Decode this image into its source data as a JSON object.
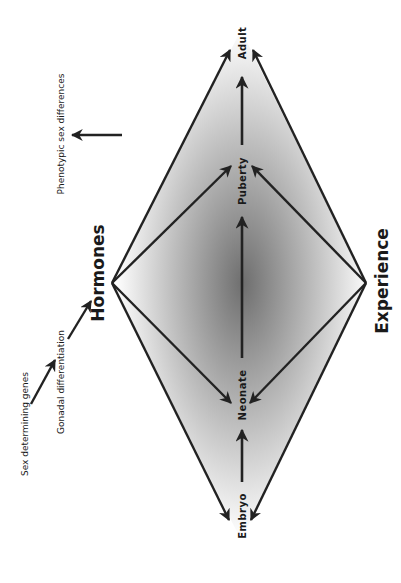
{
  "diagram": {
    "stages": [
      {
        "id": "embryo",
        "label": "Embryo"
      },
      {
        "id": "neonate",
        "label": "Neonate"
      },
      {
        "id": "puberty",
        "label": "Puberty"
      },
      {
        "id": "adult",
        "label": "Adult"
      }
    ],
    "influences": {
      "hormones": "Hormones",
      "experience": "Experience"
    },
    "pathway": {
      "sex_determining_genes": "Sex determining genes",
      "gonadal_differentiation": "Gonadal differentiation",
      "phenotypic_sex_differences": "Phenotypic sex differences"
    },
    "colors": {
      "line": "#222222",
      "gradient_center": "#7a7a7a",
      "gradient_edge": "#ffffff"
    }
  }
}
